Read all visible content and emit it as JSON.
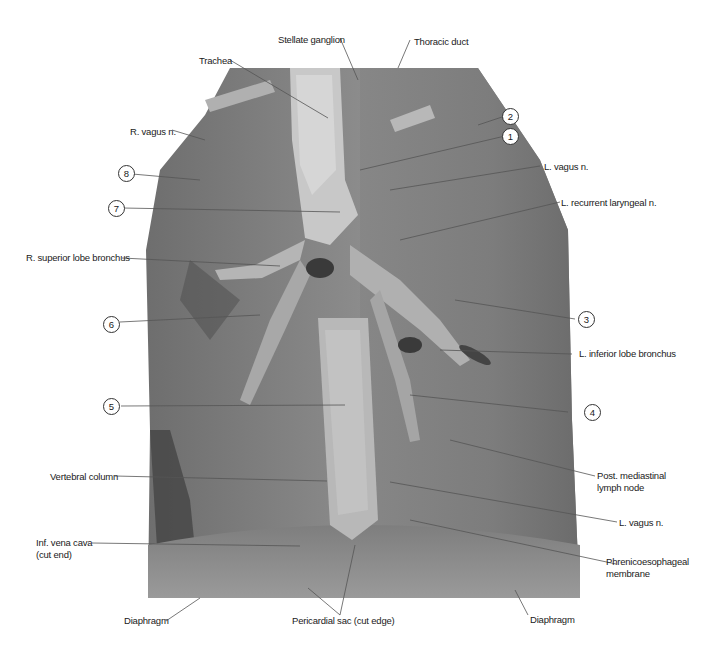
{
  "figure": {
    "type": "anatomical-dissection-photo",
    "colors": {
      "background": "#ffffff",
      "specimen_mid": "#8a8a8a",
      "specimen_dark": "#4a4a4a",
      "specimen_light": "#cfcfcf",
      "leader": "#555555"
    }
  },
  "labels": {
    "stellate_ganglion": "Stellate ganglion",
    "thoracic_duct": "Thoracic duct",
    "trachea": "Trachea",
    "r_vagus": "R. vagus n.",
    "l_vagus_upper": "L. vagus n.",
    "l_recurrent_laryngeal": "L. recurrent laryngeal n.",
    "r_superior_lobe_bronchus": "R. superior lobe bronchus",
    "l_inferior_lobe_bronchus": "L. inferior lobe bronchus",
    "vertebral_column": "Vertebral column",
    "post_mediastinal_lymph_node_1": "Post. mediastinal",
    "post_mediastinal_lymph_node_2": "lymph node",
    "l_vagus_lower": "L. vagus n.",
    "inf_vena_cava_1": "Inf. vena cava",
    "inf_vena_cava_2": "(cut end)",
    "phrenicoesophageal_1": "Phrenicoesophageal",
    "phrenicoesophageal_2": "membrane",
    "diaphragm_left": "Diaphragm",
    "diaphragm_right": "Diaphragm",
    "pericardial_sac": "Pericardial sac (cut edge)"
  },
  "numbered_callouts": [
    "1",
    "2",
    "3",
    "4",
    "5",
    "6",
    "7",
    "8"
  ]
}
